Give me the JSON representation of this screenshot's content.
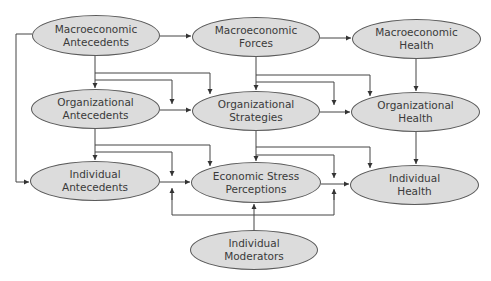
{
  "diagram": {
    "nodes": [
      {
        "id": "macro-antecedents",
        "label": "Macroeconomic\nAntecedents",
        "x": 32,
        "y": 15,
        "w": 128,
        "h": 41
      },
      {
        "id": "macro-forces",
        "label": "Macroeconomic\nForces",
        "x": 192,
        "y": 17,
        "w": 128,
        "h": 40
      },
      {
        "id": "macro-health",
        "label": "Macroeconomic\nHealth",
        "x": 352,
        "y": 19,
        "w": 129,
        "h": 40
      },
      {
        "id": "org-antecedents",
        "label": "Organizational\nAntecedents",
        "x": 31,
        "y": 89,
        "w": 129,
        "h": 40
      },
      {
        "id": "org-strategies",
        "label": "Organizational\nStrategies",
        "x": 192,
        "y": 91,
        "w": 128,
        "h": 40
      },
      {
        "id": "org-health",
        "label": "Organizational\nHealth",
        "x": 351,
        "y": 92,
        "w": 129,
        "h": 40
      },
      {
        "id": "ind-antecedents",
        "label": "Individual\nAntecedents",
        "x": 30,
        "y": 161,
        "w": 130,
        "h": 40
      },
      {
        "id": "econ-stress",
        "label": "Economic Stress\nPerceptions",
        "x": 191,
        "y": 162,
        "w": 130,
        "h": 41
      },
      {
        "id": "ind-health",
        "label": "Individual\nHealth",
        "x": 350,
        "y": 165,
        "w": 129,
        "h": 40
      },
      {
        "id": "ind-moderators",
        "label": "Individual\nModerators",
        "x": 190,
        "y": 230,
        "w": 128,
        "h": 40
      }
    ],
    "colors": {
      "fill": "#dcdcdc",
      "stroke": "#5a5a5a",
      "text": "#3a3a3a",
      "line": "#444444"
    }
  }
}
